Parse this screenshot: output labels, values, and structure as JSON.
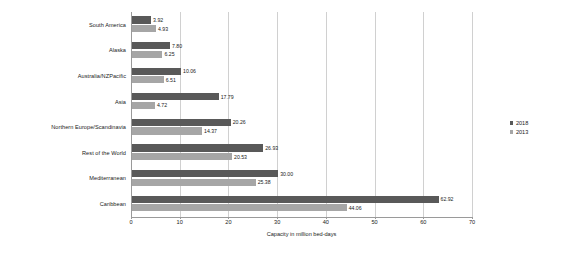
{
  "chart_data": {
    "type": "bar",
    "orientation": "horizontal",
    "title": "",
    "xlabel": "Capacity in million bed-days",
    "ylabel": "",
    "xlim": [
      0,
      70
    ],
    "xticks": [
      0,
      10,
      20,
      30,
      40,
      50,
      60,
      70
    ],
    "grid": true,
    "legend_position": "right",
    "categories": [
      "South America",
      "Alaska",
      "Australia/NZPacific",
      "Asia",
      "Northern Europe/Scandinavia",
      "Rest of the World",
      "Mediterranean",
      "Caribbean"
    ],
    "series": [
      {
        "name": "2018",
        "color": "#595959",
        "values": [
          3.92,
          7.8,
          10.06,
          17.79,
          20.26,
          26.93,
          30.0,
          62.92
        ]
      },
      {
        "name": "2013",
        "color": "#a6a6a6",
        "values": [
          4.93,
          6.25,
          6.51,
          4.72,
          14.37,
          20.53,
          25.38,
          44.06
        ]
      }
    ],
    "value_labels": {
      "2018": [
        "3.92",
        "7.80",
        "10.06",
        "17.79",
        "20.26",
        "26.93",
        "30.00",
        "62.92"
      ],
      "2013": [
        "4.93",
        "6.25",
        "6.51",
        "4.72",
        "14.37",
        "20.53",
        "25.38",
        "44.06"
      ]
    }
  },
  "axis": {
    "x_tick_labels": [
      "0",
      "10",
      "20",
      "30",
      "40",
      "50",
      "60",
      "70"
    ],
    "x_title": "Capacity in million bed-days"
  },
  "legend": {
    "items": [
      {
        "label": "2018",
        "color": "#595959"
      },
      {
        "label": "2013",
        "color": "#a6a6a6"
      }
    ]
  },
  "colors": {
    "series_2018": "#595959",
    "series_2013": "#a6a6a6",
    "gridline": "#d0d0d0",
    "axis": "#9a9a9a",
    "background": "#ffffff"
  }
}
